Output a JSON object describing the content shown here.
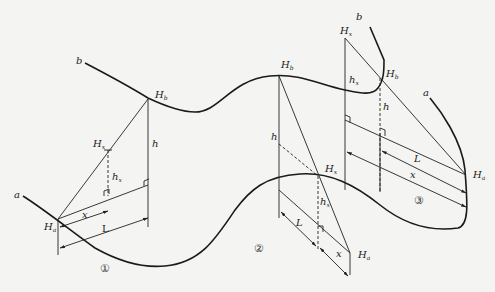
{
  "figure": {
    "curve_labels": {
      "start": "a",
      "end": "b"
    },
    "case1": {
      "number": "①",
      "points": {
        "Ha": "H",
        "Ha_sub": "a",
        "Hb": "H",
        "Hb_sub": "b",
        "Hx": "H",
        "Hx_sub": "x"
      },
      "labels": {
        "h": "h",
        "hx": "h",
        "hx_sub": "x",
        "x": "x",
        "L": "L"
      }
    },
    "case2": {
      "number": "②",
      "points": {
        "Hb": "H",
        "Hb_sub": "b",
        "Hx": "H",
        "Hx_sub": "x",
        "Ha": "H",
        "Ha_sub": "a"
      },
      "labels": {
        "h": "h",
        "hx": "h",
        "hx_sub": "x",
        "x": "x",
        "L": "L"
      }
    },
    "case3": {
      "number": "③",
      "points": {
        "Hx": "H",
        "Hx_sub": "x",
        "Hb": "H",
        "Hb_sub": "b",
        "Ha": "H",
        "Ha_sub": "a"
      },
      "labels": {
        "h": "h",
        "hx": "h",
        "hx_sub": "x",
        "x": "x",
        "L": "L",
        "a": "a",
        "b": "b"
      }
    }
  }
}
